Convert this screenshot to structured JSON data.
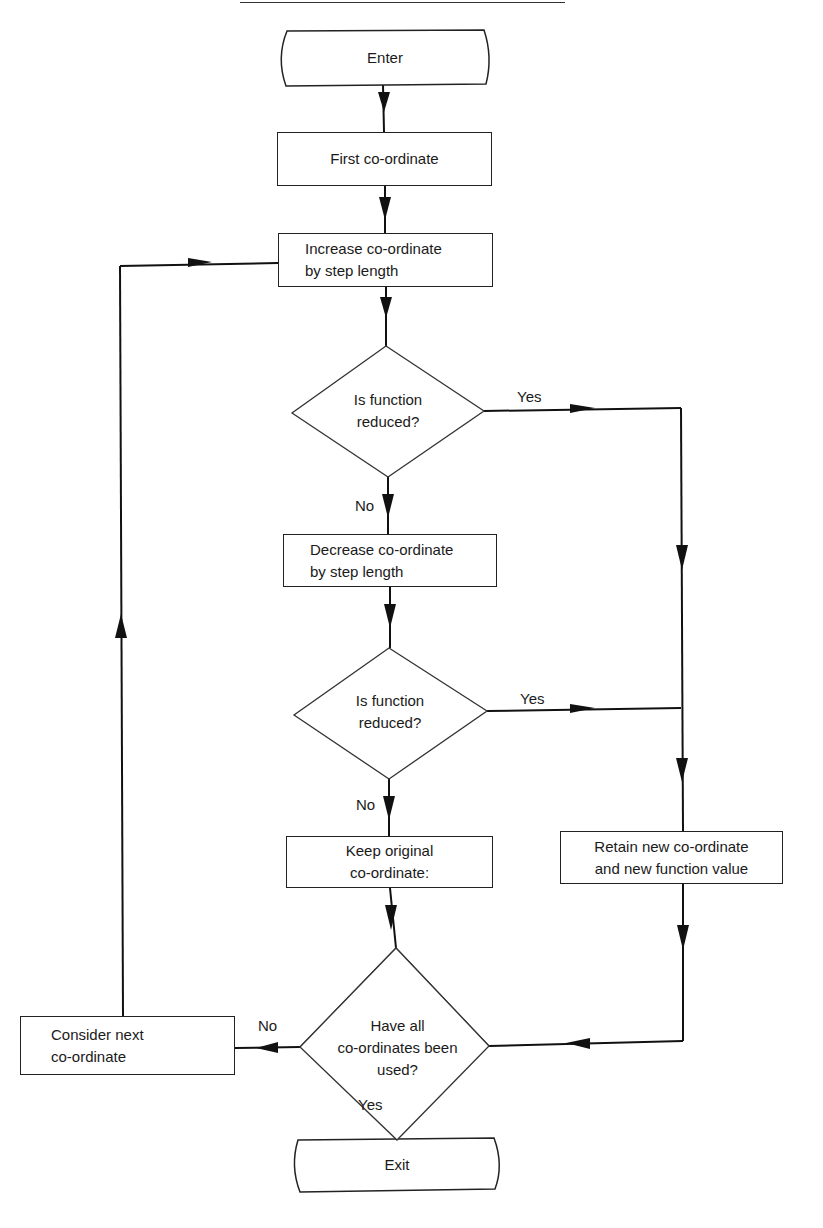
{
  "flowchart": {
    "terminals": {
      "start": "Enter",
      "end": "Exit"
    },
    "processes": {
      "first": "First co-ordinate",
      "increase_l1": "Increase co-ordinate",
      "increase_l2": "by step length",
      "decrease_l1": "Decrease co-ordinate",
      "decrease_l2": "by step length",
      "keep_l1": "Keep original",
      "keep_l2": "co-ordinate:",
      "retain_l1": "Retain new co-ordinate",
      "retain_l2": "and new function value",
      "next_l1": "Consider next",
      "next_l2": "co-ordinate"
    },
    "decisions": {
      "d1_l1": "Is function",
      "d1_l2": "reduced?",
      "d2_l1": "Is function",
      "d2_l2": "reduced?",
      "d3_l1": "Have all",
      "d3_l2": "co-ordinates been",
      "d3_l3": "used?"
    },
    "edge_labels": {
      "d1_yes": "Yes",
      "d1_no": "No",
      "d2_yes": "Yes",
      "d2_no": "No",
      "d3_no": "No",
      "d3_yes": "Yes"
    }
  }
}
